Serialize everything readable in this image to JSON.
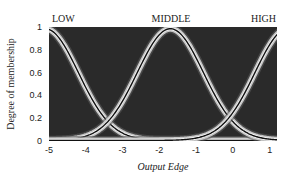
{
  "chart_data": {
    "type": "line",
    "title": "",
    "xlabel": "Output Edge",
    "ylabel": "Degree of membership",
    "xlim": [
      -5,
      1.2
    ],
    "ylim": [
      0,
      1
    ],
    "xticks": [
      -5,
      -4,
      -3,
      -2,
      -1,
      0,
      1
    ],
    "xtick_labels": [
      "-5",
      "-4",
      "-3",
      "-2",
      "-1",
      "0",
      "1"
    ],
    "yticks": [
      0,
      0.2,
      0.4,
      0.6,
      0.8,
      1
    ],
    "ytick_labels": [
      "0",
      "0.2",
      "0.4",
      "0.6",
      "0.8",
      "1"
    ],
    "grid": false,
    "legend": "none",
    "background": "#2a2a2a",
    "series": [
      {
        "name": "LOW",
        "shape": "gaussian",
        "center": -5.1,
        "sigma": 0.9
      },
      {
        "name": "MIDDLE",
        "shape": "gaussian",
        "center": -1.7,
        "sigma": 0.9
      },
      {
        "name": "HIGH",
        "shape": "gaussian",
        "center": 1.5,
        "sigma": 0.9
      }
    ],
    "annotations": [
      {
        "text": "LOW",
        "x": -4.8,
        "y": 1.05
      },
      {
        "text": "MIDDLE",
        "x": -1.7,
        "y": 1.05
      },
      {
        "text": "HIGH",
        "x": 0.9,
        "y": 1.05
      }
    ]
  },
  "labels": {
    "low": "LOW",
    "middle": "MIDDLE",
    "high": "HIGH",
    "xlabel": "Output Edge",
    "ylabel": "Degree of membership"
  }
}
